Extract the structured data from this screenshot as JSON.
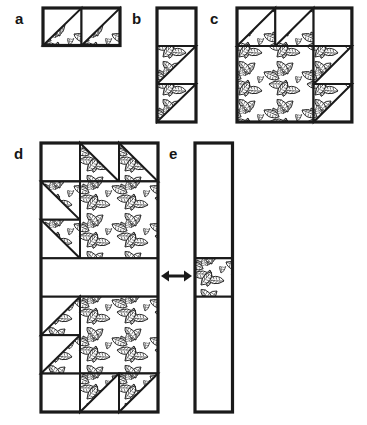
{
  "figure": {
    "kind": "quilt-block-assembly-diagram",
    "background": "#ffffff",
    "ink": "#1a1a1a",
    "fabric": "leaf-print"
  },
  "panels": [
    {
      "id": "a",
      "label": "a",
      "label_pos": {
        "x": 15,
        "y": 11
      },
      "grid": {
        "x": 43,
        "y": 8,
        "cols": 2,
        "rows": 1,
        "cell_w": 38.5,
        "cell_h": 37.5
      },
      "cells": [
        {
          "r": 0,
          "c": 0,
          "type": "hst",
          "leaf_corner": "lower-right"
        },
        {
          "r": 0,
          "c": 1,
          "type": "hst",
          "leaf_corner": "lower-right"
        }
      ]
    },
    {
      "id": "b",
      "label": "b",
      "label_pos": {
        "x": 132,
        "y": 11
      },
      "grid": {
        "x": 157,
        "y": 8,
        "cols": 1,
        "rows": 3,
        "cell_w": 39,
        "cell_h": 38
      },
      "cells": [
        {
          "r": 0,
          "c": 0,
          "type": "plain"
        },
        {
          "r": 1,
          "c": 0,
          "type": "hst",
          "leaf_corner": "upper-left"
        },
        {
          "r": 2,
          "c": 0,
          "type": "hst",
          "leaf_corner": "upper-left"
        }
      ]
    },
    {
      "id": "c",
      "label": "c",
      "label_pos": {
        "x": 210,
        "y": 11
      },
      "grid": {
        "x": 237,
        "y": 8,
        "cols": 3,
        "rows": 3,
        "cell_w": 38.3,
        "cell_h": 38
      },
      "cells": [
        {
          "r": 0,
          "c": 0,
          "type": "hst",
          "leaf_corner": "lower-right"
        },
        {
          "r": 0,
          "c": 1,
          "type": "hst",
          "leaf_corner": "lower-right"
        },
        {
          "r": 0,
          "c": 2,
          "type": "plain"
        },
        {
          "r": 1,
          "c": 0,
          "type": "leaf",
          "cs": 2,
          "rs": 2
        },
        {
          "r": 1,
          "c": 2,
          "type": "hst",
          "leaf_corner": "upper-left"
        },
        {
          "r": 2,
          "c": 2,
          "type": "hst",
          "leaf_corner": "upper-left"
        }
      ]
    },
    {
      "id": "d",
      "label": "d",
      "label_pos": {
        "x": 14,
        "y": 146
      },
      "grid": {
        "x": 41,
        "y": 143,
        "cols": 3,
        "rows": 7,
        "cell_w": 39,
        "cell_h": 38.43
      },
      "cells": [
        {
          "r": 0,
          "c": 0,
          "type": "plain"
        },
        {
          "r": 0,
          "c": 1,
          "type": "hst",
          "leaf_corner": "lower-left"
        },
        {
          "r": 0,
          "c": 2,
          "type": "hst",
          "leaf_corner": "lower-left"
        },
        {
          "r": 1,
          "c": 0,
          "type": "hst",
          "leaf_corner": "upper-right"
        },
        {
          "r": 2,
          "c": 0,
          "type": "hst",
          "leaf_corner": "upper-right"
        },
        {
          "r": 1,
          "c": 1,
          "type": "leaf",
          "cs": 2,
          "rs": 2
        },
        {
          "r": 3,
          "c": 0,
          "type": "plain",
          "cs": 3
        },
        {
          "r": 4,
          "c": 0,
          "type": "hst",
          "leaf_corner": "lower-right"
        },
        {
          "r": 5,
          "c": 0,
          "type": "hst",
          "leaf_corner": "lower-right"
        },
        {
          "r": 4,
          "c": 1,
          "type": "leaf",
          "cs": 2,
          "rs": 2
        },
        {
          "r": 6,
          "c": 0,
          "type": "plain"
        },
        {
          "r": 6,
          "c": 1,
          "type": "hst",
          "leaf_corner": "upper-left"
        },
        {
          "r": 6,
          "c": 2,
          "type": "hst",
          "leaf_corner": "upper-left"
        }
      ]
    },
    {
      "id": "e",
      "label": "e",
      "label_pos": {
        "x": 169,
        "y": 146
      },
      "grid": {
        "x": 195,
        "y": 143,
        "cols": 1,
        "rows": 7,
        "cell_w": 37.5,
        "cell_h": 38.43
      },
      "cells": [
        {
          "r": 0,
          "c": 0,
          "type": "plain",
          "rs": 3
        },
        {
          "r": 3,
          "c": 0,
          "type": "leaf"
        },
        {
          "r": 4,
          "c": 0,
          "type": "plain",
          "rs": 3
        }
      ]
    }
  ],
  "arrow": {
    "name": "double-arrow",
    "x1": 161,
    "x2": 192,
    "y": 276
  }
}
